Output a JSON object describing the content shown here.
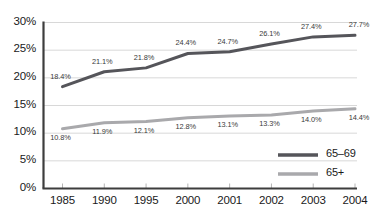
{
  "chart_data": {
    "type": "line",
    "title": "",
    "subtitle": "",
    "xlabel": "",
    "ylabel": "",
    "categories": [
      "1985",
      "1990",
      "1995",
      "2000",
      "2001",
      "2002",
      "2003",
      "2004"
    ],
    "ylim": [
      0,
      30
    ],
    "ytick_labels": [
      "0%",
      "5%",
      "10%",
      "15%",
      "20%",
      "25%",
      "30%"
    ],
    "ytick_values": [
      0,
      5,
      10,
      15,
      20,
      25,
      30
    ],
    "grid": true,
    "legend_position": "bottom-right",
    "series": [
      {
        "name": "65–69",
        "color": "#55555a",
        "values": [
          18.4,
          21.1,
          21.8,
          24.4,
          24.7,
          26.1,
          27.4,
          27.7
        ],
        "labels": [
          "18.4%",
          "21.1%",
          "21.8%",
          "24.4%",
          "24.7%",
          "26.1%",
          "27.4%",
          "27.7%"
        ],
        "label_side": "above"
      },
      {
        "name": "65+",
        "color": "#a9a9ac",
        "values": [
          10.8,
          11.9,
          12.1,
          12.8,
          13.1,
          13.3,
          14.0,
          14.4
        ],
        "labels": [
          "10.8%",
          "11.9%",
          "12.1%",
          "12.8%",
          "13.1%",
          "13.3%",
          "14.0%",
          "14.4%"
        ],
        "label_side": "below"
      }
    ]
  },
  "legend": {
    "items": [
      {
        "label": "65–69",
        "color": "#55555a"
      },
      {
        "label": "65+",
        "color": "#a9a9ac"
      }
    ]
  },
  "axis": {
    "axis_color": "#3d3d3d",
    "grid_color": "#d8d8d8"
  }
}
